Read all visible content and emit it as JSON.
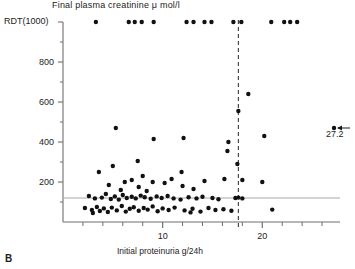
{
  "panel": {
    "label": "B"
  },
  "chart_data": {
    "type": "scatter",
    "title": "Final plasma creatinine μ mol/l",
    "xlabel": "Initial proteinuria g/24h",
    "ylabel": "",
    "y_top_label": "RDT(1000)",
    "xlim": [
      0,
      27.8
    ],
    "ylim": [
      0,
      1000
    ],
    "xticks_major": [
      10,
      20
    ],
    "xticks_minor": [
      2,
      4,
      6,
      8,
      12,
      14,
      16,
      18,
      22,
      24,
      26
    ],
    "xtick_labels": [
      "10",
      "20"
    ],
    "yticks_major": [
      200,
      400,
      600,
      800
    ],
    "yticks_minor": [
      100,
      300,
      500,
      700,
      900
    ],
    "ytick_labels": [
      "200",
      "400",
      "600",
      "800"
    ],
    "grid": false,
    "legend": null,
    "reference_lines": [
      {
        "orientation": "horizontal",
        "value": 120,
        "style": "solid",
        "color": "#a8a8a8"
      },
      {
        "orientation": "vertical",
        "value": 17.6,
        "style": "dashed",
        "color": "#3a3a3a"
      }
    ],
    "annotations": [
      {
        "text": "27.2",
        "x": 27.2,
        "y": 470,
        "arrow": "left"
      }
    ],
    "point_color": "#111111",
    "points": [
      {
        "x": 3.3,
        "y": 1000
      },
      {
        "x": 6.6,
        "y": 1000
      },
      {
        "x": 7.2,
        "y": 1000
      },
      {
        "x": 7.9,
        "y": 1000
      },
      {
        "x": 9.1,
        "y": 1000
      },
      {
        "x": 12.4,
        "y": 1000
      },
      {
        "x": 13.1,
        "y": 1000
      },
      {
        "x": 14.2,
        "y": 1000
      },
      {
        "x": 14.9,
        "y": 1000
      },
      {
        "x": 17.1,
        "y": 1000
      },
      {
        "x": 17.9,
        "y": 1000
      },
      {
        "x": 20.9,
        "y": 1000
      },
      {
        "x": 22.2,
        "y": 1000
      },
      {
        "x": 22.8,
        "y": 1000
      },
      {
        "x": 23.5,
        "y": 1000
      },
      {
        "x": 18.6,
        "y": 640
      },
      {
        "x": 17.6,
        "y": 555
      },
      {
        "x": 5.3,
        "y": 470
      },
      {
        "x": 27.2,
        "y": 470
      },
      {
        "x": 20.2,
        "y": 430
      },
      {
        "x": 9.1,
        "y": 415
      },
      {
        "x": 16.6,
        "y": 400
      },
      {
        "x": 16.5,
        "y": 355
      },
      {
        "x": 12.1,
        "y": 420
      },
      {
        "x": 5.0,
        "y": 280
      },
      {
        "x": 7.5,
        "y": 305
      },
      {
        "x": 17.5,
        "y": 290
      },
      {
        "x": 3.6,
        "y": 250
      },
      {
        "x": 11.9,
        "y": 250
      },
      {
        "x": 16.2,
        "y": 215
      },
      {
        "x": 18.0,
        "y": 210
      },
      {
        "x": 8.0,
        "y": 230
      },
      {
        "x": 6.2,
        "y": 200
      },
      {
        "x": 4.6,
        "y": 185
      },
      {
        "x": 7.6,
        "y": 175
      },
      {
        "x": 9.0,
        "y": 200
      },
      {
        "x": 10.2,
        "y": 195
      },
      {
        "x": 12.0,
        "y": 180
      },
      {
        "x": 13.1,
        "y": 165
      },
      {
        "x": 5.8,
        "y": 160
      },
      {
        "x": 8.4,
        "y": 155
      },
      {
        "x": 14.2,
        "y": 205
      },
      {
        "x": 20.0,
        "y": 200
      },
      {
        "x": 10.9,
        "y": 215
      },
      {
        "x": 6.9,
        "y": 210
      },
      {
        "x": 2.6,
        "y": 130
      },
      {
        "x": 3.2,
        "y": 118
      },
      {
        "x": 3.9,
        "y": 122
      },
      {
        "x": 4.3,
        "y": 140
      },
      {
        "x": 4.8,
        "y": 115
      },
      {
        "x": 5.2,
        "y": 128
      },
      {
        "x": 5.6,
        "y": 112
      },
      {
        "x": 6.0,
        "y": 135
      },
      {
        "x": 6.4,
        "y": 120
      },
      {
        "x": 6.9,
        "y": 126
      },
      {
        "x": 7.3,
        "y": 118
      },
      {
        "x": 7.8,
        "y": 132
      },
      {
        "x": 8.2,
        "y": 124
      },
      {
        "x": 8.8,
        "y": 116
      },
      {
        "x": 9.4,
        "y": 128
      },
      {
        "x": 9.9,
        "y": 120
      },
      {
        "x": 10.5,
        "y": 130
      },
      {
        "x": 11.1,
        "y": 118
      },
      {
        "x": 11.8,
        "y": 112
      },
      {
        "x": 12.6,
        "y": 124
      },
      {
        "x": 13.4,
        "y": 118
      },
      {
        "x": 14.0,
        "y": 126
      },
      {
        "x": 15.0,
        "y": 120
      },
      {
        "x": 15.6,
        "y": 114
      },
      {
        "x": 17.3,
        "y": 120
      },
      {
        "x": 17.6,
        "y": 122
      },
      {
        "x": 18.0,
        "y": 118
      },
      {
        "x": 2.2,
        "y": 70
      },
      {
        "x": 2.9,
        "y": 60
      },
      {
        "x": 3.4,
        "y": 75
      },
      {
        "x": 3.7,
        "y": 55
      },
      {
        "x": 4.1,
        "y": 68
      },
      {
        "x": 4.5,
        "y": 50
      },
      {
        "x": 4.9,
        "y": 72
      },
      {
        "x": 5.4,
        "y": 58
      },
      {
        "x": 5.9,
        "y": 80
      },
      {
        "x": 6.3,
        "y": 52
      },
      {
        "x": 6.7,
        "y": 66
      },
      {
        "x": 7.1,
        "y": 74
      },
      {
        "x": 7.6,
        "y": 56
      },
      {
        "x": 8.1,
        "y": 70
      },
      {
        "x": 8.5,
        "y": 62
      },
      {
        "x": 9.0,
        "y": 78
      },
      {
        "x": 9.5,
        "y": 54
      },
      {
        "x": 10.0,
        "y": 68
      },
      {
        "x": 10.6,
        "y": 60
      },
      {
        "x": 11.2,
        "y": 72
      },
      {
        "x": 12.2,
        "y": 58
      },
      {
        "x": 13.0,
        "y": 66
      },
      {
        "x": 13.8,
        "y": 52
      },
      {
        "x": 14.6,
        "y": 70
      },
      {
        "x": 15.3,
        "y": 60
      },
      {
        "x": 16.1,
        "y": 64
      },
      {
        "x": 16.9,
        "y": 56
      },
      {
        "x": 21.0,
        "y": 62
      },
      {
        "x": 3.0,
        "y": 45
      },
      {
        "x": 12.8,
        "y": 48
      }
    ]
  }
}
